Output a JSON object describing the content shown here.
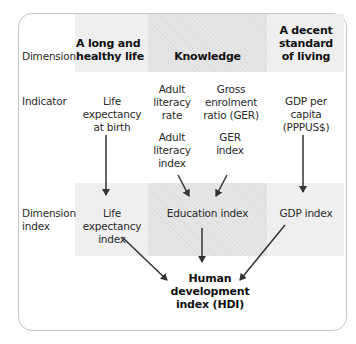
{
  "rows": {
    "dimension": "Dimension",
    "indicator": "Indicator",
    "dimension_index_1": "Dimension",
    "dimension_index_2": "index"
  },
  "dimensions": {
    "health": [
      "A long and",
      "healthy life"
    ],
    "knowledge": "Knowledge",
    "living": [
      "A decent",
      "standard",
      "of living"
    ]
  },
  "indicators": {
    "life_expectancy": [
      "Life",
      "expectancy",
      "at birth"
    ],
    "adult_literacy_rate": [
      "Adult",
      "literacy",
      "rate"
    ],
    "ger": [
      "Gross",
      "enrolment",
      "ratio (GER)"
    ],
    "adult_literacy_index": [
      "Adult",
      "literacy",
      "index"
    ],
    "ger_index": [
      "GER",
      "index"
    ],
    "gdp": [
      "GDP per",
      "capita",
      "(PPPUS$)"
    ]
  },
  "dimension_indices": {
    "life_expectancy_index": [
      "Life",
      "expectancy",
      "index"
    ],
    "education_index": "Education index",
    "gdp_index": "GDP index"
  },
  "result": {
    "hdi": [
      "Human",
      "development",
      "index (HDI)"
    ]
  },
  "colors": {
    "shade_light": "#efefef",
    "shade_dark": "#e2e2e2",
    "border": "#c4c4c4",
    "arrow": "#333333"
  }
}
